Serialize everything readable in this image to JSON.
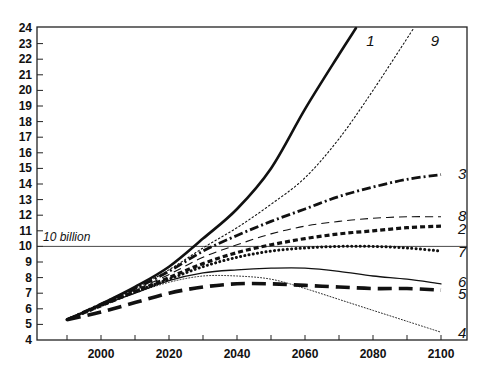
{
  "chart_data": {
    "type": "line",
    "title": "",
    "xlabel": "",
    "ylabel": "",
    "xlim": [
      1990,
      2100
    ],
    "ylim": [
      4,
      24
    ],
    "x_ticks": [
      2000,
      2020,
      2040,
      2060,
      2080,
      2100
    ],
    "x_minor_ticks": [
      1990,
      2010,
      2030,
      2050,
      2070,
      2090
    ],
    "y_ticks": [
      4,
      5,
      6,
      7,
      8,
      9,
      10,
      11,
      12,
      13,
      14,
      15,
      16,
      17,
      18,
      19,
      20,
      21,
      22,
      23,
      24
    ],
    "grid": false,
    "reference_line": {
      "y": 10,
      "label": "10 billion"
    },
    "series": [
      {
        "name": "1",
        "style": "solid-thick",
        "x": [
          1990,
          2000,
          2010,
          2020,
          2030,
          2040,
          2050,
          2060,
          2070,
          2075
        ],
        "values": [
          5.3,
          6.3,
          7.4,
          8.7,
          10.5,
          12.4,
          15.0,
          18.8,
          22.3,
          24.0
        ]
      },
      {
        "name": "9",
        "style": "dotted-thin",
        "x": [
          1990,
          2000,
          2010,
          2020,
          2030,
          2040,
          2050,
          2060,
          2070,
          2080,
          2092
        ],
        "values": [
          5.3,
          6.3,
          7.3,
          8.5,
          9.9,
          11.2,
          12.7,
          14.4,
          16.9,
          20.0,
          24.0
        ]
      },
      {
        "name": "3",
        "style": "dash-dot-thick",
        "x": [
          1990,
          2000,
          2010,
          2020,
          2030,
          2040,
          2050,
          2060,
          2070,
          2080,
          2090,
          2100
        ],
        "values": [
          5.3,
          6.3,
          7.3,
          8.4,
          9.7,
          10.7,
          11.6,
          12.4,
          13.2,
          13.8,
          14.3,
          14.6
        ]
      },
      {
        "name": "8",
        "style": "dashed-thin",
        "x": [
          1990,
          2000,
          2010,
          2020,
          2030,
          2040,
          2050,
          2060,
          2070,
          2080,
          2090,
          2100
        ],
        "values": [
          5.3,
          6.3,
          7.2,
          8.2,
          9.3,
          10.1,
          10.8,
          11.3,
          11.6,
          11.8,
          11.9,
          11.9
        ]
      },
      {
        "name": "2",
        "style": "dashed-heavy-short",
        "x": [
          1990,
          2000,
          2010,
          2020,
          2030,
          2040,
          2050,
          2060,
          2070,
          2080,
          2090,
          2100
        ],
        "values": [
          5.3,
          6.2,
          7.1,
          8.0,
          8.9,
          9.6,
          10.1,
          10.5,
          10.8,
          11.0,
          11.2,
          11.3
        ]
      },
      {
        "name": "7",
        "style": "dotted-heavy",
        "x": [
          1990,
          2000,
          2010,
          2020,
          2030,
          2040,
          2050,
          2060,
          2070,
          2080,
          2090,
          2100
        ],
        "values": [
          5.3,
          6.2,
          7.1,
          7.9,
          8.7,
          9.3,
          9.7,
          9.9,
          10.0,
          10.0,
          9.9,
          9.7
        ]
      },
      {
        "name": "6",
        "style": "solid-thin",
        "x": [
          1990,
          2000,
          2010,
          2020,
          2030,
          2040,
          2050,
          2060,
          2070,
          2080,
          2090,
          2100
        ],
        "values": [
          5.3,
          6.2,
          7.0,
          7.8,
          8.3,
          8.5,
          8.6,
          8.6,
          8.4,
          8.1,
          7.9,
          7.6
        ]
      },
      {
        "name": "5",
        "style": "dashed-heavy-long",
        "x": [
          1990,
          2000,
          2010,
          2020,
          2030,
          2040,
          2050,
          2060,
          2070,
          2080,
          2090,
          2100
        ],
        "values": [
          5.3,
          5.8,
          6.4,
          7.0,
          7.4,
          7.6,
          7.6,
          7.5,
          7.4,
          7.3,
          7.3,
          7.2
        ]
      },
      {
        "name": "4",
        "style": "dotted-fine",
        "x": [
          1990,
          2000,
          2010,
          2020,
          2030,
          2040,
          2050,
          2060,
          2070,
          2080,
          2090,
          2100
        ],
        "values": [
          5.3,
          6.2,
          7.0,
          7.7,
          8.1,
          8.1,
          7.9,
          7.3,
          6.6,
          5.9,
          5.2,
          4.5
        ]
      }
    ],
    "labels": [
      {
        "text": "1",
        "x": 2078,
        "y": 23.2
      },
      {
        "text": "9",
        "x": 2097,
        "y": 23.2
      },
      {
        "text": "3",
        "x": 2105,
        "y": 14.7
      },
      {
        "text": "8",
        "x": 2105,
        "y": 12.0
      },
      {
        "text": "2",
        "x": 2105,
        "y": 11.2
      },
      {
        "text": "7",
        "x": 2105,
        "y": 9.7
      },
      {
        "text": "6",
        "x": 2105,
        "y": 7.8
      },
      {
        "text": "5",
        "x": 2105,
        "y": 7.0
      },
      {
        "text": "4",
        "x": 2105,
        "y": 4.5
      }
    ]
  }
}
